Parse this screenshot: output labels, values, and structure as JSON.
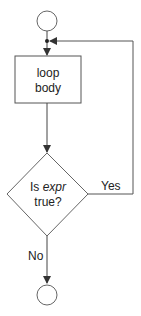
{
  "diagram": {
    "type": "flowchart",
    "nodes": {
      "start": {
        "shape": "circle"
      },
      "loop_body": {
        "shape": "rectangle",
        "line1": "loop",
        "line2": "body"
      },
      "decision": {
        "shape": "diamond",
        "line1_prefix": "Is ",
        "line1_emph": "expr",
        "line2": "true?"
      },
      "end": {
        "shape": "circle"
      }
    },
    "edges": {
      "yes_label": "Yes",
      "no_label": "No"
    },
    "colors": {
      "stroke": "#555555",
      "text": "#222222",
      "background": "#ffffff"
    }
  }
}
